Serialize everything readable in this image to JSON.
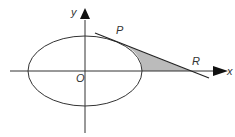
{
  "figure": {
    "type": "ellipse-tangent-diagram",
    "labels": {
      "y_axis": "y",
      "x_axis": "x",
      "origin": "O",
      "point_p": "P",
      "point_r": "R"
    },
    "colors": {
      "stroke": "#333333",
      "shade": "#bbbbbb",
      "background": "#ffffff"
    }
  }
}
